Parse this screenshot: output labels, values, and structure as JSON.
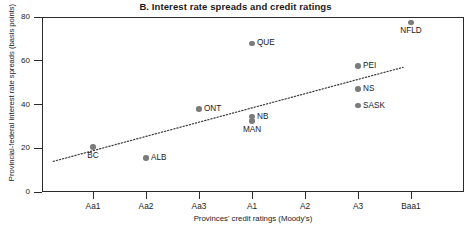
{
  "chart_data": {
    "type": "scatter",
    "title": "B. Interest rate spreads and credit ratings",
    "xlabel": "Provinces' credit ratings (Moody's)",
    "ylabel": "Provincial-federal interest rate spreads (basis points)",
    "categories": [
      "Aa1",
      "Aa2",
      "Aa3",
      "A1",
      "A2",
      "A3",
      "Baa1"
    ],
    "yticks": [
      0,
      20,
      40,
      60,
      80
    ],
    "ylim": [
      0,
      80
    ],
    "grid": false,
    "legend": null,
    "points": [
      {
        "label": "BC",
        "rating": "Aa1",
        "x": 1.0,
        "y": 20.5,
        "label_pos": "below"
      },
      {
        "label": "ALB",
        "rating": "Aa2",
        "x": 2.0,
        "y": 15.5,
        "label_pos": "right"
      },
      {
        "label": "ONT",
        "rating": "Aa3",
        "x": 3.0,
        "y": 38.0,
        "label_pos": "right"
      },
      {
        "label": "QUE",
        "rating": "A1",
        "x": 4.0,
        "y": 68.0,
        "label_pos": "right"
      },
      {
        "label": "NB",
        "rating": "A1",
        "x": 4.0,
        "y": 34.5,
        "label_pos": "right"
      },
      {
        "label": "MAN",
        "rating": "A1",
        "x": 4.0,
        "y": 32.5,
        "label_pos": "below"
      },
      {
        "label": "PEI",
        "rating": "A3",
        "x": 6.0,
        "y": 57.5,
        "label_pos": "right"
      },
      {
        "label": "NS",
        "rating": "A3",
        "x": 6.0,
        "y": 47.0,
        "label_pos": "right"
      },
      {
        "label": "SASK",
        "rating": "A3",
        "x": 6.0,
        "y": 39.5,
        "label_pos": "right"
      },
      {
        "label": "NFLD",
        "rating": "Baa1",
        "x": 7.0,
        "y": 77.5,
        "label_pos": "below"
      }
    ],
    "trendline": {
      "style": "dotted",
      "x_start": 0.25,
      "y_start": 14.0,
      "x_end": 6.85,
      "y_end": 57.0
    },
    "colors": {
      "marker": "#7b7b7b",
      "axis": "#2b2b2b",
      "text": "#1a1a1a",
      "trend": "#3a3a3a"
    }
  }
}
